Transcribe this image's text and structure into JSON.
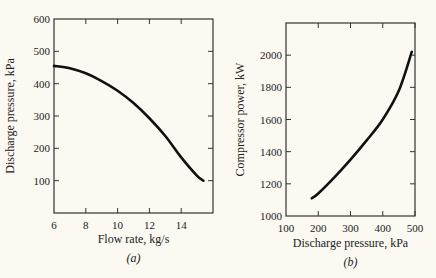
{
  "chart_data": [
    {
      "type": "line",
      "panel": "a",
      "caption": "(a)",
      "title": "",
      "xlabel": "Flow rate, kg/s",
      "ylabel": "Discharge pressure, kPa",
      "xlim": [
        6,
        16
      ],
      "ylim": [
        0,
        600
      ],
      "xticks": [
        6,
        8,
        10,
        12,
        14
      ],
      "yticks": [
        100,
        200,
        300,
        400,
        500,
        600
      ],
      "grid": false,
      "series": [
        {
          "name": "Discharge pressure vs flow rate",
          "x": [
            6,
            7,
            8,
            9,
            10,
            11,
            12,
            13,
            14,
            15,
            15.4
          ],
          "y": [
            455,
            448,
            432,
            408,
            378,
            340,
            293,
            238,
            172,
            115,
            100
          ]
        }
      ]
    },
    {
      "type": "line",
      "panel": "b",
      "caption": "(b)",
      "title": "",
      "xlabel": "Discharge pressure, kPa",
      "ylabel": "Compressor power, kW",
      "xlim": [
        100,
        500
      ],
      "ylim": [
        1000,
        2200
      ],
      "xticks": [
        100,
        200,
        300,
        400,
        500
      ],
      "yticks": [
        1000,
        1200,
        1400,
        1600,
        1800,
        2000
      ],
      "grid": false,
      "series": [
        {
          "name": "Compressor power vs discharge pressure",
          "x": [
            180,
            200,
            250,
            300,
            350,
            400,
            450,
            490
          ],
          "y": [
            1110,
            1140,
            1240,
            1350,
            1470,
            1600,
            1780,
            2020
          ]
        }
      ]
    }
  ]
}
